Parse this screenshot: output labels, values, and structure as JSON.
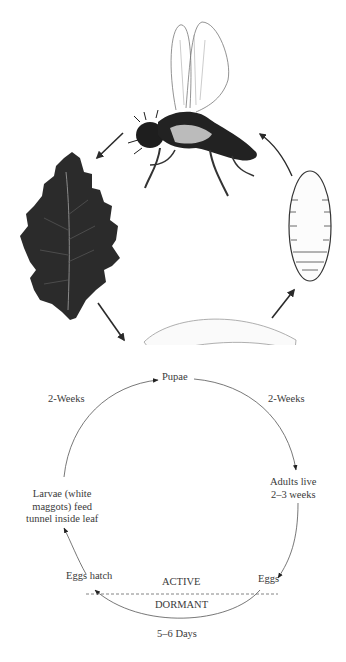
{
  "illustration": {
    "stages": [
      {
        "id": "adult",
        "name": "adult-fly"
      },
      {
        "id": "leaf",
        "name": "mined-leaf"
      },
      {
        "id": "larva",
        "name": "larva-maggot"
      },
      {
        "id": "pupa",
        "name": "pupa"
      }
    ],
    "colors": {
      "ink": "#1e1e1e",
      "leaf": "#2b2b2b",
      "outline": "#555555"
    }
  },
  "cycle": {
    "nodes": {
      "pupae": "Pupae",
      "adults": "Adults live\n2–3 weeks",
      "eggs": "Eggs",
      "eggs_hatch": "Eggs hatch",
      "larvae": "Larvae (white\nmaggots) feed\ntunnel inside leaf"
    },
    "durations": {
      "larvae_to_pupae": "2-Weeks",
      "pupae_to_adults": "2-Weeks",
      "eggs_to_hatch": "5–6 Days"
    },
    "zones": {
      "active": "ACTIVE",
      "dormant": "DORMANT"
    },
    "colors": {
      "line": "#444444",
      "text": "#3a3a3a"
    }
  }
}
